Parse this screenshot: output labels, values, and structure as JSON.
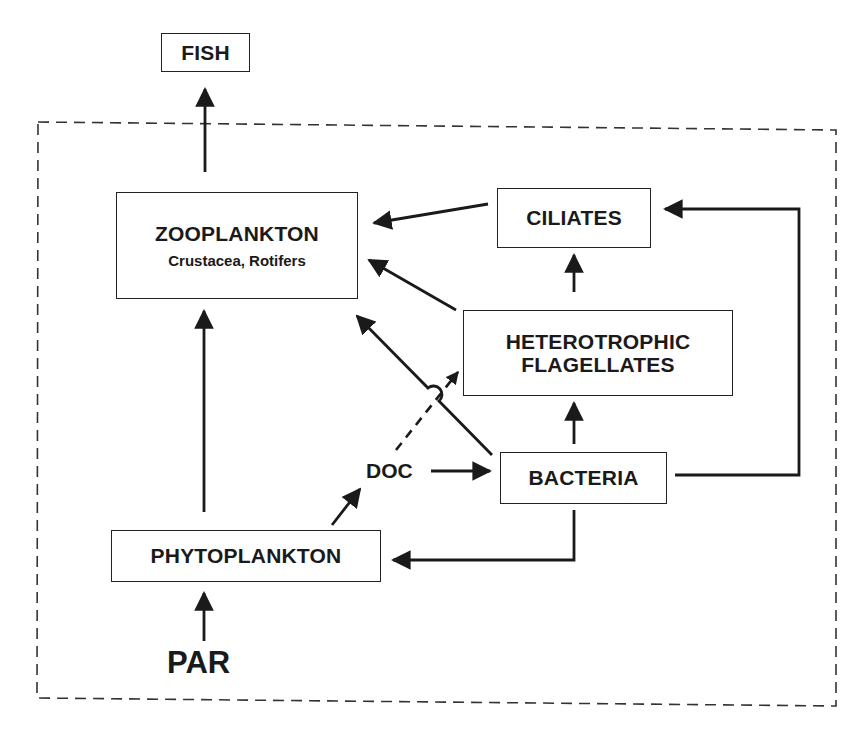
{
  "diagram": {
    "type": "food-web / microbial loop flow diagram",
    "boundary": {
      "style": "dashed",
      "meaning": "system boundary"
    },
    "nodes": {
      "fish": {
        "label": "FISH"
      },
      "zooplankton": {
        "label": "ZOOPLANKTON",
        "sublabel": "Crustacea, Rotifers"
      },
      "ciliates": {
        "label": "CILIATES"
      },
      "heterotrophic_flagellates": {
        "line1": "HETEROTROPHIC",
        "line2": "FLAGELLATES"
      },
      "bacteria": {
        "label": "BACTERIA"
      },
      "phytoplankton": {
        "label": "PHYTOPLANKTON"
      },
      "doc": {
        "label": "DOC"
      },
      "par": {
        "label": "PAR"
      }
    },
    "edges": [
      {
        "from": "ZOOPLANKTON",
        "to": "FISH",
        "style": "solid"
      },
      {
        "from": "CILIATES",
        "to": "ZOOPLANKTON",
        "style": "solid"
      },
      {
        "from": "HETEROTROPHIC FLAGELLATES",
        "to": "ZOOPLANKTON",
        "style": "solid"
      },
      {
        "from": "BACTERIA",
        "to": "ZOOPLANKTON",
        "style": "solid"
      },
      {
        "from": "HETEROTROPHIC FLAGELLATES",
        "to": "CILIATES",
        "style": "solid"
      },
      {
        "from": "BACTERIA",
        "to": "HETEROTROPHIC FLAGELLATES",
        "style": "solid"
      },
      {
        "from": "BACTERIA",
        "to": "CILIATES",
        "style": "solid"
      },
      {
        "from": "DOC",
        "to": "BACTERIA",
        "style": "solid"
      },
      {
        "from": "DOC",
        "to": "HETEROTROPHIC FLAGELLATES",
        "style": "dashed"
      },
      {
        "from": "PHYTOPLANKTON",
        "to": "DOC",
        "style": "solid"
      },
      {
        "from": "PHYTOPLANKTON",
        "to": "ZOOPLANKTON",
        "style": "solid"
      },
      {
        "from": "BACTERIA",
        "to": "PHYTOPLANKTON",
        "style": "solid"
      },
      {
        "from": "PAR",
        "to": "PHYTOPLANKTON",
        "style": "solid"
      }
    ],
    "colors": {
      "ink": "#1a1a1a",
      "background": "#ffffff"
    }
  }
}
